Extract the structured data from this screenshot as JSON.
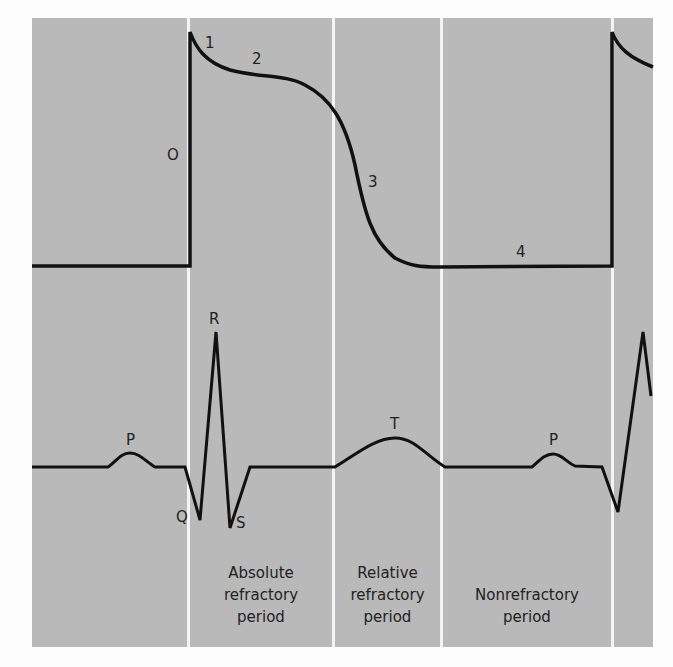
{
  "figure": {
    "title": "",
    "background_color": "#b9b9b9",
    "divider_color": "#f4f4f4",
    "trace_color": "#111111"
  },
  "action_potential": {
    "phase_labels": {
      "phase0": "O",
      "phase1": "1",
      "phase2": "2",
      "phase3": "3",
      "phase4": "4"
    }
  },
  "ecg": {
    "wave_labels": {
      "p1": "P",
      "q": "Q",
      "r": "R",
      "s": "S",
      "t": "T",
      "p2": "P"
    }
  },
  "periods": {
    "absolute": {
      "line1": "Absolute",
      "line2": "refractory",
      "line3": "period"
    },
    "relative": {
      "line1": "Relative",
      "line2": "refractory",
      "line3": "period"
    },
    "nonrefractory": {
      "line1": "Nonrefractory",
      "line2": "period"
    }
  }
}
